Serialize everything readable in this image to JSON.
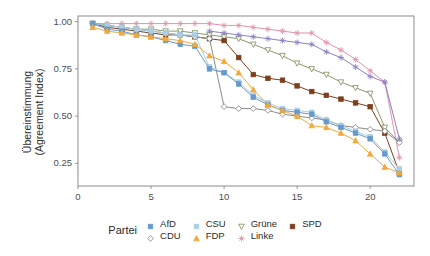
{
  "chart_data": {
    "type": "line",
    "title": "",
    "subtitle": "",
    "xlabel": "",
    "ylabel": "Übereinstimmung\n(Agreement Index)",
    "ylabel_lines": [
      "Übereinstimmung",
      "(Agreement Index)"
    ],
    "xlim": [
      0,
      23
    ],
    "ylim": [
      0.13,
      1.03
    ],
    "xticks": [
      0,
      5,
      10,
      15,
      20
    ],
    "yticks": [
      0.25,
      0.5,
      0.75,
      1.0
    ],
    "ytick_labels": [
      "0.25",
      "0.50",
      "0.75",
      "1.00"
    ],
    "xtick_labels": [
      "0",
      "5",
      "10",
      "15",
      "20"
    ],
    "grid": false,
    "legend_position": "bottom",
    "legend_title": "Partei",
    "x": [
      1,
      2,
      3,
      4,
      5,
      6,
      7,
      8,
      9,
      10,
      11,
      12,
      13,
      14,
      15,
      16,
      17,
      18,
      19,
      20,
      21,
      22
    ],
    "series": [
      {
        "name": "AfD",
        "color": "#6699cc",
        "marker": "square",
        "values": [
          0.99,
          0.96,
          0.95,
          0.93,
          0.92,
          0.9,
          0.88,
          0.87,
          0.75,
          0.73,
          0.67,
          0.6,
          0.56,
          0.53,
          0.52,
          0.51,
          0.47,
          0.44,
          0.41,
          0.38,
          0.3,
          0.19
        ]
      },
      {
        "name": "CDU",
        "color": "#8c8c8c",
        "marker": "diamond-open",
        "values": [
          0.99,
          0.98,
          0.97,
          0.96,
          0.95,
          0.94,
          0.93,
          0.92,
          0.91,
          0.55,
          0.54,
          0.54,
          0.53,
          0.51,
          0.5,
          0.49,
          0.48,
          0.45,
          0.44,
          0.43,
          0.42,
          0.36
        ]
      },
      {
        "name": "CSU",
        "color": "#a8cfe5",
        "marker": "square",
        "values": [
          0.99,
          0.98,
          0.97,
          0.96,
          0.95,
          0.94,
          0.93,
          0.93,
          0.76,
          0.73,
          0.68,
          0.61,
          0.57,
          0.54,
          0.53,
          0.52,
          0.48,
          0.45,
          0.42,
          0.39,
          0.31,
          0.22
        ]
      },
      {
        "name": "FDP",
        "color": "#f2a93b",
        "marker": "triangle-up",
        "values": [
          0.97,
          0.95,
          0.94,
          0.93,
          0.92,
          0.91,
          0.9,
          0.88,
          0.82,
          0.79,
          0.73,
          0.64,
          0.56,
          0.53,
          0.5,
          0.45,
          0.44,
          0.41,
          0.37,
          0.3,
          0.23,
          0.2
        ]
      },
      {
        "name": "Grüne",
        "color": "#8a9a6b",
        "marker": "triangle-down-open",
        "values": [
          0.99,
          0.98,
          0.97,
          0.96,
          0.96,
          0.95,
          0.95,
          0.94,
          0.93,
          0.92,
          0.91,
          0.88,
          0.85,
          0.82,
          0.78,
          0.75,
          0.72,
          0.68,
          0.65,
          0.62,
          0.44,
          0.36
        ]
      },
      {
        "name": "Linke",
        "color": "#e193ad",
        "marker": "asterisk",
        "values": [
          0.99,
          0.99,
          0.99,
          0.99,
          0.99,
          0.99,
          0.99,
          0.99,
          0.99,
          0.98,
          0.98,
          0.97,
          0.96,
          0.95,
          0.94,
          0.94,
          0.89,
          0.85,
          0.8,
          0.74,
          0.68,
          0.28
        ]
      },
      {
        "name": "SPD",
        "color": "#7b3f1d",
        "marker": "square",
        "values": [
          0.99,
          0.97,
          0.96,
          0.95,
          0.94,
          0.93,
          0.93,
          0.92,
          0.91,
          0.9,
          0.81,
          0.72,
          0.7,
          0.69,
          0.66,
          0.63,
          0.61,
          0.59,
          0.57,
          0.55,
          0.41,
          0.2
        ]
      }
    ],
    "extra_series": [
      {
        "name": "Linke-secondary",
        "color": "#8f7fc4",
        "marker": "asterisk",
        "values": [
          null,
          null,
          null,
          null,
          null,
          null,
          null,
          null,
          0.95,
          0.94,
          0.93,
          0.92,
          0.91,
          0.9,
          0.89,
          0.88,
          0.84,
          0.81,
          0.76,
          0.71,
          0.68,
          0.38
        ]
      }
    ]
  },
  "legend": {
    "title": "Partei",
    "items": [
      {
        "label": "AfD",
        "color": "#6699cc",
        "marker": "square"
      },
      {
        "label": "CDU",
        "color": "#8c8c8c",
        "marker": "diamond-open"
      },
      {
        "label": "CSU",
        "color": "#a8cfe5",
        "marker": "square"
      },
      {
        "label": "FDP",
        "color": "#f2a93b",
        "marker": "triangle-up"
      },
      {
        "label": "Grüne",
        "color": "#8a9a6b",
        "marker": "triangle-down-open"
      },
      {
        "label": "Linke",
        "color": "#e193ad",
        "marker": "asterisk"
      },
      {
        "label": "SPD",
        "color": "#7b3f1d",
        "marker": "square"
      }
    ]
  },
  "panel": {
    "border_color": "#808080",
    "background": "#ffffff",
    "axis_color": "#808080"
  }
}
